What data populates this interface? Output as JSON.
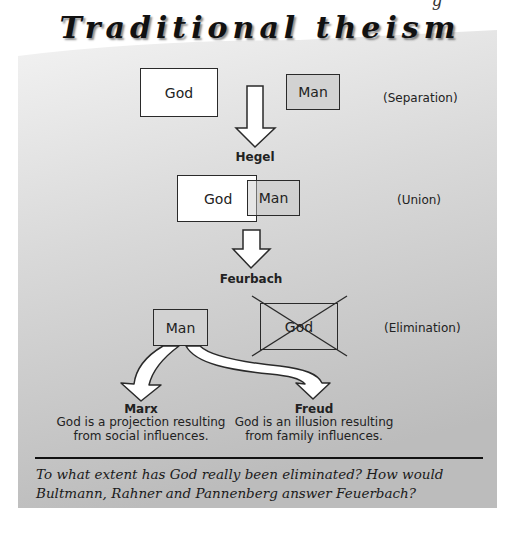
{
  "header": {
    "partial_top_glyph": "g",
    "title": "Traditional theism"
  },
  "panel": {
    "gradient_top": "#f2f2f2",
    "gradient_bottom": "#bcbcbc"
  },
  "stages": {
    "separation": {
      "god_label": "God",
      "man_label": "Man",
      "caption": "(Separation)"
    },
    "transition_1": {
      "label": "Hegel"
    },
    "union": {
      "god_label": "God",
      "man_label": "Man",
      "caption": "(Union)"
    },
    "transition_2": {
      "label": "Feurbach"
    },
    "elimination": {
      "man_label": "Man",
      "god_label": "God",
      "caption": "(Elimination)"
    }
  },
  "branches": [
    {
      "name": "Marx",
      "line1": "God is a projection resulting",
      "line2": "from social influences."
    },
    {
      "name": "Freud",
      "line1": "God is an illusion resulting",
      "line2": "from family influences."
    }
  ],
  "question": {
    "text": "To what extent has God really been eliminated? How would Bultmann, Rahner and Pannenberg answer Feuerbach?"
  }
}
